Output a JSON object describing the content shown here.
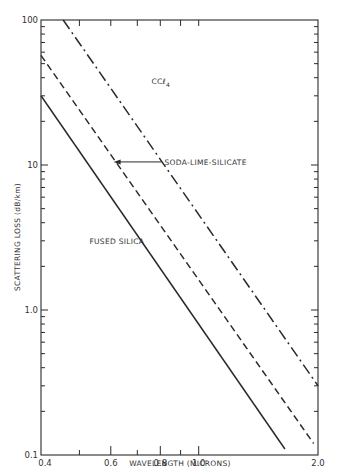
{
  "chart_data": {
    "type": "line",
    "title": "",
    "xlabel": "WAVELENGTH (MICRONS)",
    "ylabel": "SCATTERING LOSS (dB/km)",
    "xscale": "log",
    "yscale": "log",
    "xlim": [
      0.4,
      2.0
    ],
    "ylim": [
      0.1,
      100
    ],
    "grid": false,
    "x_tick_labels": [
      "0.4",
      "0.6",
      "0.8",
      "1.0",
      "2.0"
    ],
    "x_ticks": [
      0.4,
      0.5,
      0.6,
      0.7,
      0.8,
      0.9,
      1.0,
      2.0
    ],
    "y_tick_labels": [
      "0.1",
      "1.0",
      "10",
      "100"
    ],
    "y_ticks_major": [
      0.1,
      1.0,
      10,
      100
    ],
    "series": [
      {
        "name": "FUSED SILICA",
        "style": "solid",
        "x": [
          0.4,
          1.65
        ],
        "y": [
          30,
          0.11
        ]
      },
      {
        "name": "SODA-LIME-SILICATE",
        "style": "dashed",
        "x": [
          0.4,
          1.95
        ],
        "y": [
          57,
          0.12
        ]
      },
      {
        "name": "CCl4",
        "style": "dash-dot",
        "x": [
          0.455,
          2.0
        ],
        "y": [
          100,
          0.3
        ]
      }
    ],
    "annotations": [
      {
        "text": "CCl4",
        "label_main": "CCℓ",
        "label_sub": "4",
        "x": 0.76,
        "y": 36
      },
      {
        "text": "SODA-LIME-SILICATE",
        "x": 0.82,
        "y": 10.5,
        "arrow_to_x": 0.61,
        "arrow_to_y": 10.5
      },
      {
        "text": "FUSED SILICA",
        "x": 0.53,
        "y": 3.0
      }
    ]
  },
  "axes": {
    "x_title": "WAVELENGTH (MICRONS)",
    "y_title": "SCATTERING LOSS (dB/km)"
  },
  "colors": {
    "ink": "#2a2a2a",
    "background": "#ffffff"
  }
}
